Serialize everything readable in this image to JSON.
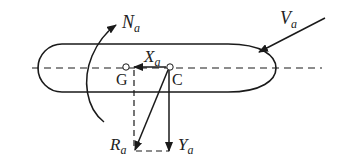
{
  "diagram": {
    "colors": {
      "stroke": "#1a1a1a",
      "background": "#ffffff",
      "point_fill": "#ffffff"
    },
    "points": {
      "G": {
        "label": "G"
      },
      "C": {
        "label": "C"
      }
    },
    "forces": {
      "N": {
        "symbol": "N",
        "subscript": "a"
      },
      "V": {
        "symbol": "V",
        "subscript": "a"
      },
      "X": {
        "symbol": "X",
        "subscript": "a"
      },
      "Y": {
        "symbol": "Y",
        "subscript": "a"
      },
      "R": {
        "symbol": "R",
        "subscript": "a"
      }
    }
  }
}
